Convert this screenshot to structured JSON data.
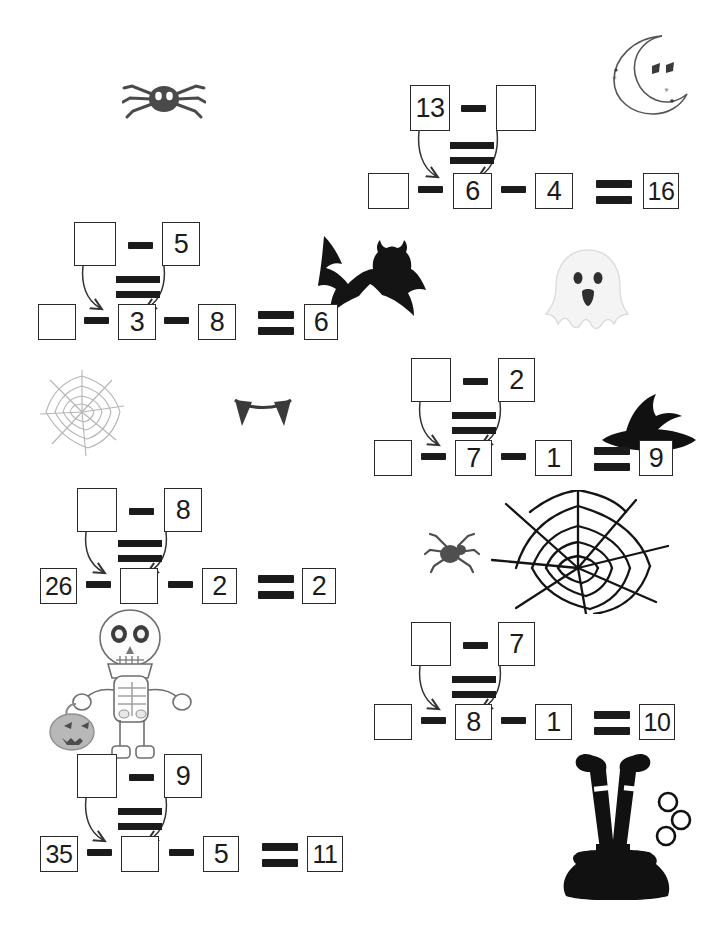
{
  "worksheet": {
    "theme": "halloween-subtraction",
    "operator_minus": "-",
    "operator_equals": "=",
    "blank": ""
  },
  "problems": [
    {
      "id": "problem-1",
      "top": {
        "left": "13",
        "right": ""
      },
      "bottom": {
        "first": "",
        "middle": "6",
        "third": "4",
        "result": "16"
      }
    },
    {
      "id": "problem-2",
      "top": {
        "left": "",
        "right": "5"
      },
      "bottom": {
        "first": "",
        "middle": "3",
        "third": "8",
        "result": "6"
      }
    },
    {
      "id": "problem-3",
      "top": {
        "left": "",
        "right": "2"
      },
      "bottom": {
        "first": "",
        "middle": "7",
        "third": "1",
        "result": "9"
      }
    },
    {
      "id": "problem-4",
      "top": {
        "left": "",
        "right": "8"
      },
      "bottom": {
        "first": "26",
        "middle": "",
        "third": "2",
        "result": "2"
      }
    },
    {
      "id": "problem-5",
      "top": {
        "left": "",
        "right": "7"
      },
      "bottom": {
        "first": "",
        "middle": "8",
        "third": "1",
        "result": "10"
      }
    },
    {
      "id": "problem-6",
      "top": {
        "left": "",
        "right": "9"
      },
      "bottom": {
        "first": "35",
        "middle": "",
        "third": "5",
        "result": "11"
      }
    }
  ],
  "decorations": [
    {
      "name": "spider-icon",
      "label": "spider"
    },
    {
      "name": "moon-icon",
      "label": "crescent moon with face"
    },
    {
      "name": "bat-icon",
      "label": "bat"
    },
    {
      "name": "ghost-icon",
      "label": "ghost"
    },
    {
      "name": "spiderweb-small-icon",
      "label": "spider web"
    },
    {
      "name": "fangs-icon",
      "label": "vampire fangs"
    },
    {
      "name": "witch-hat-icon",
      "label": "witch hat"
    },
    {
      "name": "spiderweb-large-icon",
      "label": "large spider web"
    },
    {
      "name": "spider-small-icon",
      "label": "small spider"
    },
    {
      "name": "skeleton-icon",
      "label": "skeleton with pumpkin bucket"
    },
    {
      "name": "cauldron-icon",
      "label": "witch legs in cauldron"
    }
  ],
  "colors": {
    "ink": "#1b1b1b",
    "box_border": "#2b2b2b",
    "paper": "#ffffff",
    "spider_gray": "#4a4a4a",
    "web_light": "#b9b9b9",
    "ghost_pale": "#f2f2f2",
    "skeleton_line": "#6b6b6b"
  }
}
